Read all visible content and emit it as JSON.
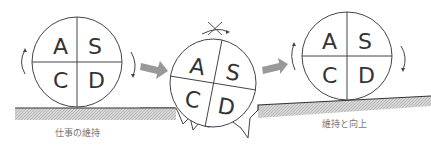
{
  "diagram": {
    "type": "PDCA wheel progression",
    "wheels": [
      {
        "id": "left",
        "quadrants": [
          "A",
          "S",
          "C",
          "D"
        ],
        "state": "rolling on flat ground"
      },
      {
        "id": "middle",
        "quadrants": [
          "A",
          "S",
          "C",
          "D"
        ],
        "state": "stuck in pit, rotation blocked"
      },
      {
        "id": "right",
        "quadrants": [
          "A",
          "S",
          "C",
          "D"
        ],
        "state": "rolling up slope"
      }
    ],
    "captions": {
      "left": "仕事の維持",
      "right": "維持と向上"
    },
    "colors": {
      "arrow": "#999999",
      "ground": "#bbbbbb",
      "line": "#333333"
    }
  }
}
